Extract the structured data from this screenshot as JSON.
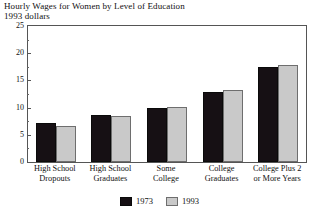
{
  "chart_data": {
    "type": "bar",
    "title": "Hourly Wages for Women by Level of Education",
    "subtitle": "1993 dollars",
    "xlabel": "",
    "ylabel": "",
    "ylim": [
      0,
      25
    ],
    "ytick_labels": [
      "0",
      "5",
      "10",
      "15",
      "20",
      "25"
    ],
    "ytick_values": [
      0,
      5,
      10,
      15,
      20,
      25
    ],
    "yminor_values": [
      2.5,
      7.5,
      12.5,
      17.5,
      22.5
    ],
    "grid": false,
    "legend_position": "bottom-center",
    "categories": [
      "High School Dropouts",
      "High School Graduates",
      "Some College",
      "College Graduates",
      "College Plus 2 or More Years"
    ],
    "category_lines": [
      [
        "High School",
        "Dropouts"
      ],
      [
        "High School",
        "Graduates"
      ],
      [
        "Some",
        "College"
      ],
      [
        "College",
        "Graduates"
      ],
      [
        "College Plus 2",
        "or More Years"
      ]
    ],
    "series": [
      {
        "name": "1973",
        "color": "#161014",
        "values": [
          7.2,
          8.7,
          10.0,
          12.9,
          17.4
        ]
      },
      {
        "name": "1993",
        "color": "#c9c9c9",
        "values": [
          6.7,
          8.5,
          10.2,
          13.3,
          17.8
        ]
      }
    ]
  },
  "legend": {
    "items": [
      {
        "label": "1973",
        "swatch": "black-swatch"
      },
      {
        "label": "1993",
        "swatch": "gray-swatch"
      }
    ]
  }
}
